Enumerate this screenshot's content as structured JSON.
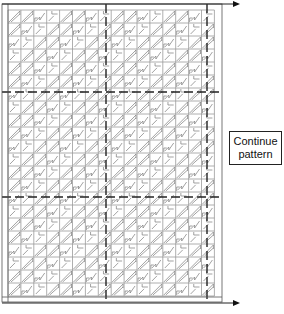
{
  "diagram": {
    "title": "",
    "callout": {
      "line1": "Continue",
      "line2": "pattern"
    },
    "grid": {
      "left": 8,
      "top": 10,
      "cell_w": 12.9,
      "cell_h": 13.0,
      "cols": 16,
      "rows": 22,
      "outer_frame": {
        "x1": 2,
        "y1": 4,
        "x2": 222,
        "y2": 302
      },
      "dashed_vertical_x": [
        106,
        207
      ],
      "dashed_horizontal_y": [
        92,
        197
      ]
    },
    "arrows": [
      {
        "name": "top-arrow",
        "x1": 2,
        "y1": 4,
        "x2": 240,
        "y2": 4
      },
      {
        "name": "bottom-arrow",
        "x1": 2,
        "y1": 303,
        "x2": 240,
        "y2": 303
      }
    ],
    "colors": {
      "grid": "#9a9a9a",
      "pattern": "#7a7a7a",
      "dashed": "#222222",
      "frame": "#555555"
    }
  }
}
